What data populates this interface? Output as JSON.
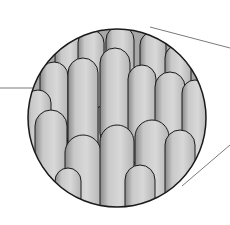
{
  "figure": {
    "title": "",
    "colors": {
      "background": "#ffffff",
      "cell_fill": "#cfcfcf",
      "cell_shade": "#6e6e6e",
      "outline": "#1a1a1a",
      "leader_line": "#7a7a7a"
    },
    "circle": {
      "cx": 117,
      "cy": 118,
      "r": 90
    },
    "leader_lines": [
      {
        "x1": 0,
        "y1": 88,
        "x2": 80,
        "y2": 88
      },
      {
        "x1": 150,
        "y1": 27,
        "x2": 230,
        "y2": 48
      },
      {
        "x1": 182,
        "y1": 186,
        "x2": 230,
        "y2": 145
      }
    ],
    "labels": []
  }
}
